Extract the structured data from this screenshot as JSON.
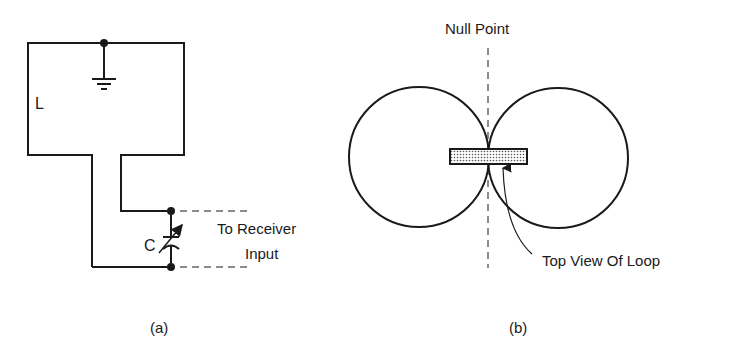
{
  "figure": {
    "panel_a": {
      "caption": "(a)",
      "labels": {
        "inductor": "L",
        "capacitor": "C",
        "output_line1": "To Receiver",
        "output_line2": "Input"
      }
    },
    "panel_b": {
      "caption": "(b)",
      "labels": {
        "null_point": "Null Point",
        "loop": "Top View Of Loop"
      }
    },
    "colors": {
      "ink": "#1a1a1a",
      "background": "#ffffff",
      "loop_fill": "#d9d9d9"
    }
  }
}
